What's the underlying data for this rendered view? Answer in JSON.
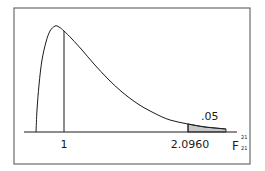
{
  "chart_data": {
    "type": "area",
    "title": "",
    "distribution": "F",
    "xlabel": "F",
    "xlabel_superscript": "21",
    "xlabel_subscript": "21",
    "ylabel": "",
    "grid": false,
    "legend": null,
    "tick_labels": [
      "1",
      "2.0960"
    ],
    "annotations": [
      {
        "text": ".05",
        "target": "shaded right tail area"
      },
      {
        "text": "1",
        "target": "vertical line at x = 1"
      },
      {
        "text": "2.0960",
        "target": "critical value, start of shaded tail"
      }
    ],
    "critical_value": 2.096,
    "tail_area": 0.05,
    "df_numerator": 21,
    "df_denominator": 21,
    "reference_line_x": 1,
    "curve_points_px": [
      [
        36,
        132
      ],
      [
        37,
        110
      ],
      [
        39,
        85
      ],
      [
        42,
        60
      ],
      [
        46,
        42
      ],
      [
        50,
        31
      ],
      [
        55,
        26
      ],
      [
        59,
        27
      ],
      [
        64,
        31
      ],
      [
        72,
        39
      ],
      [
        82,
        50
      ],
      [
        94,
        64
      ],
      [
        108,
        79
      ],
      [
        122,
        92
      ],
      [
        138,
        104
      ],
      [
        154,
        113
      ],
      [
        170,
        120
      ],
      [
        188,
        124
      ],
      [
        205,
        127
      ],
      [
        226,
        129
      ]
    ]
  },
  "labels": {
    "x_tick_1": "1",
    "x_tick_critical": "2.0960",
    "tail_area": ".05",
    "axis_variable": "F",
    "axis_sup": "21",
    "axis_sub": "21"
  },
  "colors": {
    "frame": "#6b6b6b",
    "curve": "#1a1a1a",
    "axis": "#1a1a1a",
    "shade": "#c8c8c8",
    "background": "#ffffff"
  }
}
